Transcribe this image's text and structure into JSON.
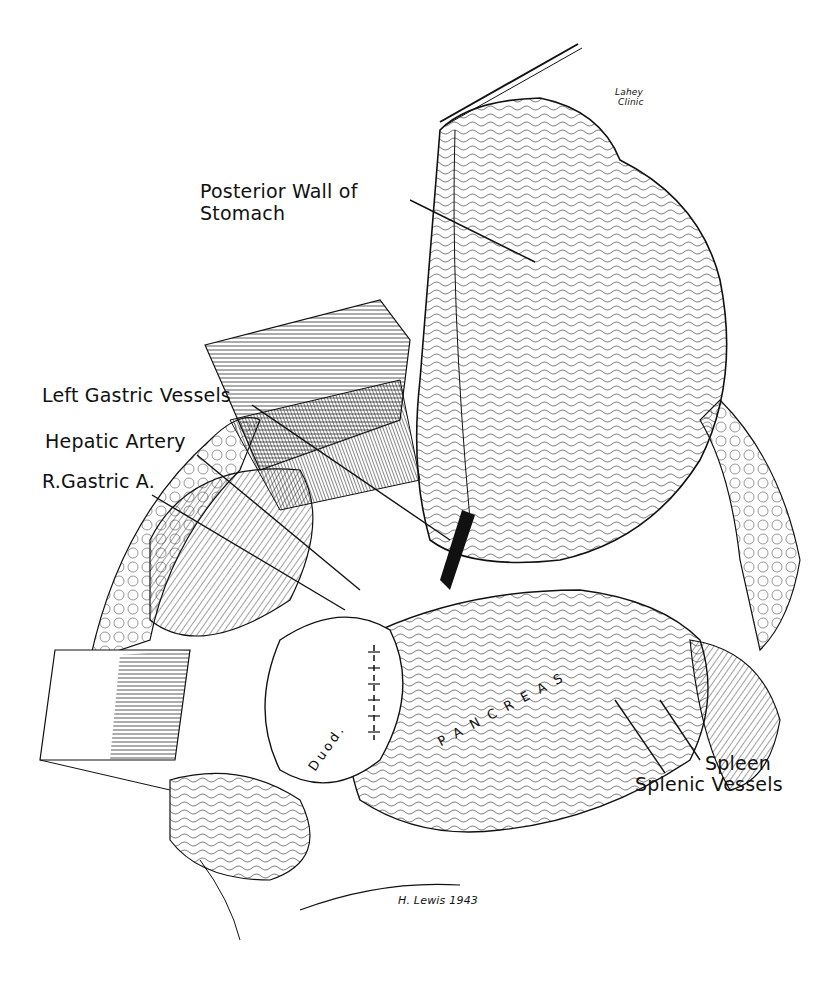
{
  "figure": {
    "type": "surgical anatomical illustration",
    "style": "pen-and-ink",
    "credit": {
      "line1": "Lahey",
      "line2": "Clinic"
    },
    "signature": "H. Lewis 1943"
  },
  "labels": {
    "posterior_wall_line1": "Posterior Wall of",
    "posterior_wall_line2": "Stomach",
    "left_gastric_vessels": "Left Gastric Vessels",
    "hepatic_artery": "Hepatic Artery",
    "r_gastric_a": "R.Gastric A.",
    "spleen": "Spleen",
    "splenic_vessels": "Splenic Vessels"
  },
  "organ_text": {
    "pancreas": "PANCREAS",
    "duod": "Duod."
  },
  "colors": {
    "ink": "#111111",
    "paper": "#ffffff"
  }
}
